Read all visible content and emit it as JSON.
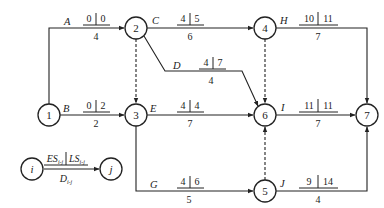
{
  "nodes": [
    {
      "id": "1",
      "label": "1"
    },
    {
      "id": "2",
      "label": "2"
    },
    {
      "id": "3",
      "label": "3"
    },
    {
      "id": "4",
      "label": "4"
    },
    {
      "id": "5",
      "label": "5"
    },
    {
      "id": "6",
      "label": "6"
    },
    {
      "id": "7",
      "label": "7"
    }
  ],
  "activities": [
    {
      "name": "A",
      "from": "1",
      "to": "2",
      "es": "0",
      "ls": "0",
      "duration": "4"
    },
    {
      "name": "B",
      "from": "1",
      "to": "3",
      "es": "0",
      "ls": "2",
      "duration": "2"
    },
    {
      "name": "C",
      "from": "2",
      "to": "4",
      "es": "4",
      "ls": "5",
      "duration": "6"
    },
    {
      "name": "D",
      "from": "2",
      "to": "6",
      "es": "4",
      "ls": "7",
      "duration": "4"
    },
    {
      "name": "E",
      "from": "3",
      "to": "6",
      "es": "4",
      "ls": "4",
      "duration": "7"
    },
    {
      "name": "G",
      "from": "3",
      "to": "5",
      "es": "4",
      "ls": "6",
      "duration": "5"
    },
    {
      "name": "H",
      "from": "4",
      "to": "7",
      "es": "10",
      "ls": "11",
      "duration": "7"
    },
    {
      "name": "I",
      "from": "6",
      "to": "7",
      "es": "11",
      "ls": "11",
      "duration": "7"
    },
    {
      "name": "J",
      "from": "5",
      "to": "7",
      "es": "9",
      "ls": "14",
      "duration": "4"
    }
  ],
  "dummies": [
    {
      "from": "2",
      "to": "3"
    },
    {
      "from": "4",
      "to": "6"
    },
    {
      "from": "5",
      "to": "6"
    }
  ],
  "legend": {
    "start_node": "i",
    "end_node": "j",
    "es_label": "ES",
    "ls_label": "LS",
    "duration_label": "D",
    "subscript": "i-j"
  }
}
